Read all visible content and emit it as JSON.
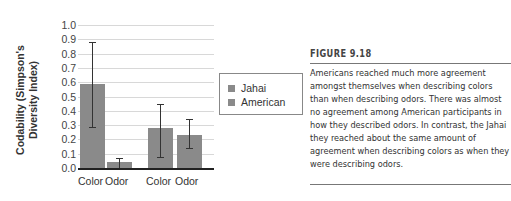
{
  "chart_data": {
    "type": "bar",
    "title": "",
    "xlabel": "",
    "ylabel": "Codability (Simpson's Diversity Index)",
    "ylim": [
      0.0,
      1.0
    ],
    "yticks": [
      "0.0",
      "0.1",
      "0.2",
      "0.3",
      "0.4",
      "0.5",
      "0.6",
      "0.7",
      "0.8",
      "0.9",
      "1.0"
    ],
    "grid": true,
    "legend_position": "right",
    "legend": [
      "Jahai",
      "American"
    ],
    "groups": [
      {
        "bars": [
          {
            "category": "Color",
            "value": 0.59,
            "err_low": 0.29,
            "err_high": 0.88
          },
          {
            "category": "Odor",
            "value": 0.04,
            "err_low": 0.0,
            "err_high": 0.07
          }
        ]
      },
      {
        "bars": [
          {
            "category": "Color",
            "value": 0.28,
            "err_low": 0.08,
            "err_high": 0.45
          },
          {
            "category": "Odor",
            "value": 0.23,
            "err_low": 0.14,
            "err_high": 0.34
          }
        ]
      }
    ],
    "categories": [
      "Color",
      "Odor",
      "Color",
      "Odor"
    ],
    "values": [
      0.59,
      0.04,
      0.28,
      0.23
    ],
    "bar_color": "#8a8a8a"
  },
  "ylabel_line1": "Codability (Simpson's",
  "ylabel_line2": "Diversity Index)",
  "legend": {
    "items": [
      "Jahai",
      "American"
    ]
  },
  "figure": {
    "title": "FIGURE 9.18",
    "caption": "Americans reached much more agreement amongst themselves when describing colors than when describing odors. There was almost no agreement among American participants in how they described odors. In contrast, the Jahai they reached about the same amount of agreement when describing colors as when they were describing odors."
  }
}
